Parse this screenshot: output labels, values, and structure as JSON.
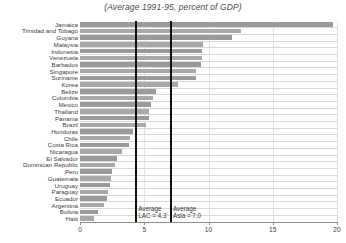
{
  "chart_data": {
    "type": "bar",
    "orientation": "horizontal",
    "title": "(Average 1991-95, percent of GDP)",
    "xlabel": "",
    "ylabel": "",
    "xlim": [
      0,
      20
    ],
    "xticks": [
      0,
      5,
      10,
      15,
      20
    ],
    "grid": true,
    "grid_axis": "x",
    "legend": "none",
    "bar_color": "#9a9a9a",
    "reference_line_color": "#111111",
    "categories": [
      "Jamaica",
      "Trinidad and Tobago",
      "Guyana",
      "Malaysia",
      "Indonesia",
      "Venezuela",
      "Barbados",
      "Singapore",
      "Suriname",
      "Korea",
      "Belize",
      "Colombia",
      "Mexico",
      "Thailand",
      "Panama",
      "Brazil",
      "Honduras",
      "Chile",
      "Costa Rica",
      "Nicaragua",
      "El Salvador",
      "Dominican Republic",
      "Peru",
      "Guatemala",
      "Uruguay",
      "Paraguay",
      "Ecuador",
      "Argentina",
      "Bolivia",
      "Haiti"
    ],
    "values": [
      19.7,
      12.5,
      11.8,
      9.6,
      9.5,
      9.5,
      9.4,
      9.0,
      9.0,
      7.6,
      5.9,
      5.7,
      5.5,
      5.4,
      5.4,
      5.1,
      4.1,
      3.9,
      3.8,
      3.3,
      2.9,
      2.7,
      2.5,
      2.4,
      2.3,
      2.2,
      2.1,
      1.9,
      1.4,
      1.1
    ],
    "annotations": [
      {
        "name": "average-lac",
        "line1": "Average",
        "line2": "LAC = 4.3",
        "value": 4.3
      },
      {
        "name": "average-asia",
        "line1": "Average",
        "line2": "Asia = 7.0",
        "value": 7.0
      }
    ]
  }
}
